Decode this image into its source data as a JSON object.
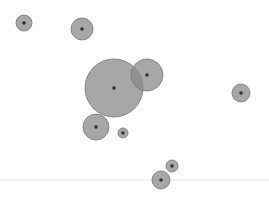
{
  "chart_data": {
    "type": "scatter",
    "subtype": "bubble",
    "title": "",
    "xlabel": "",
    "ylabel": "",
    "grid": false,
    "legend": null,
    "width": 269,
    "height": 200,
    "colors": {
      "bubble_fill": "#8a8a8a",
      "bubble_opacity": 0.75,
      "bubble_stroke": "#777777",
      "center_dot": "#333333",
      "baseline": "#eeeeee",
      "background": "#ffffff"
    },
    "points": [
      {
        "x": 24,
        "y": 23,
        "r": 8
      },
      {
        "x": 82,
        "y": 29,
        "r": 11
      },
      {
        "x": 114,
        "y": 88,
        "r": 29
      },
      {
        "x": 147,
        "y": 75,
        "r": 16
      },
      {
        "x": 241,
        "y": 93,
        "r": 9
      },
      {
        "x": 96,
        "y": 127,
        "r": 13
      },
      {
        "x": 123,
        "y": 133,
        "r": 5
      },
      {
        "x": 172,
        "y": 166,
        "r": 6
      },
      {
        "x": 161,
        "y": 180,
        "r": 9
      }
    ],
    "baseline_y": 180
  }
}
